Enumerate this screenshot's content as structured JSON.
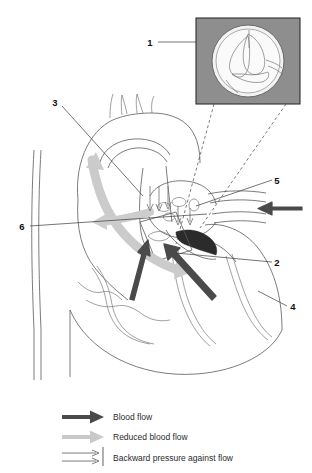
{
  "figure": {
    "background_color": "#ffffff",
    "width": 312,
    "height": 473
  },
  "inset": {
    "name": "valve-cross-section-inset",
    "background_color": "#8e8e8e",
    "border_color": "#2e2e2e",
    "content_description": "circular valve cross-section with leaflets",
    "bounds": {
      "x": 196,
      "y": 18,
      "w": 104,
      "h": 86
    }
  },
  "callouts": [
    {
      "id": "1",
      "label": "1",
      "x": 150,
      "y": 44,
      "leader_to_x": 196,
      "leader_to_y": 44
    },
    {
      "id": "2",
      "label": "2",
      "x": 277,
      "y": 264,
      "leader_to_x": 176,
      "leader_to_y": 253
    },
    {
      "id": "3",
      "label": "3",
      "x": 55,
      "y": 102,
      "leader_to_x": 142,
      "leader_to_y": 195
    },
    {
      "id": "4",
      "label": "4",
      "x": 292,
      "y": 309,
      "leader_to_x": 258,
      "leader_to_y": 291
    },
    {
      "id": "5",
      "label": "5",
      "x": 277,
      "y": 181,
      "leader_to_x": 196,
      "leader_to_y": 206
    },
    {
      "id": "6",
      "label": "6",
      "x": 22,
      "y": 228,
      "leader_to_x": 207,
      "leader_to_y": 214
    }
  ],
  "legend": {
    "name": "flow-legend",
    "items": [
      {
        "key": "blood-flow",
        "label": "Blood flow",
        "icon": "thick-dark-arrow",
        "color": "#4a4a4a"
      },
      {
        "key": "reduced-blood-flow",
        "label": "Reduced blood flow",
        "icon": "thick-light-arrow",
        "color": "#c2c2c2"
      },
      {
        "key": "backward-pressure",
        "label": "Backward pressure against flow",
        "icon": "thin-double-arrow-with-bar",
        "color": "#6e6e6e"
      }
    ]
  },
  "flow_arrows": [
    {
      "name": "reduced-flow-arrow-aorta",
      "type": "reduced-blood-flow",
      "color": "#c9c9c9"
    },
    {
      "name": "blood-flow-arrow-right-external",
      "type": "blood-flow",
      "color": "#4a4a4a"
    },
    {
      "name": "blood-flow-arrow-lower-left",
      "type": "blood-flow",
      "color": "#4a4a4a"
    },
    {
      "name": "blood-flow-arrow-lower-right",
      "type": "blood-flow",
      "color": "#4a4a4a"
    },
    {
      "name": "backward-pressure-arrows",
      "type": "backward-pressure",
      "color": "#6e6e6e"
    }
  ]
}
